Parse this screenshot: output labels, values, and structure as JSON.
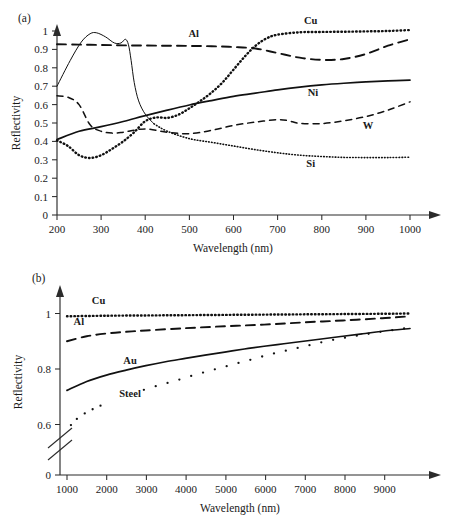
{
  "figure": {
    "background": "#ffffff",
    "ink_color": "#111111"
  },
  "chart_data": [
    {
      "id": "panel-a",
      "type": "line",
      "panel_label": "(a)",
      "title": "",
      "xlabel": "Wavelength (nm)",
      "ylabel": "Reflectivity",
      "xlim": [
        200,
        1000
      ],
      "ylim": [
        0,
        1
      ],
      "xticks": [
        200,
        300,
        400,
        500,
        600,
        700,
        800,
        900,
        1000
      ],
      "xtick_labels": [
        "200",
        "300",
        "400",
        "500",
        "600",
        "700",
        "800",
        "900",
        "1000"
      ],
      "yticks": [
        0,
        0.1,
        0.2,
        0.3,
        0.4,
        0.5,
        0.6,
        0.7,
        0.8,
        0.9,
        1
      ],
      "ytick_labels": [
        "0",
        "0.1",
        "0.2",
        "0.3",
        "0.4",
        "0.5",
        "0.6",
        "0.7",
        "0.8",
        "0.9",
        "1"
      ],
      "grid": false,
      "legend_position": "inline-curve-labels",
      "series": [
        {
          "name": "Al",
          "label": "Al",
          "style": "long-dashed",
          "label_x": 510,
          "label_y": 0.965,
          "x": [
            200,
            250,
            300,
            350,
            400,
            450,
            500,
            550,
            600,
            650,
            700,
            750,
            800,
            850,
            900,
            950,
            1000
          ],
          "values": [
            0.928,
            0.926,
            0.924,
            0.922,
            0.921,
            0.92,
            0.919,
            0.917,
            0.913,
            0.905,
            0.88,
            0.855,
            0.843,
            0.848,
            0.875,
            0.92,
            0.955
          ]
        },
        {
          "name": "Cu",
          "label": "Cu",
          "style": "dotted",
          "label_x": 775,
          "label_y": 1.04,
          "x": [
            200,
            225,
            250,
            275,
            300,
            325,
            350,
            375,
            400,
            425,
            450,
            475,
            500,
            525,
            550,
            575,
            600,
            625,
            650,
            675,
            700,
            750,
            800,
            850,
            900,
            950,
            1000
          ],
          "values": [
            0.405,
            0.375,
            0.325,
            0.31,
            0.325,
            0.36,
            0.4,
            0.45,
            0.51,
            0.53,
            0.528,
            0.545,
            0.58,
            0.62,
            0.665,
            0.72,
            0.79,
            0.86,
            0.92,
            0.96,
            0.98,
            0.993,
            0.995,
            0.996,
            0.998,
            1.0,
            1.005
          ]
        },
        {
          "name": "Ni",
          "label": "Ni",
          "style": "solid-thick",
          "label_x": 780,
          "label_y": 0.645,
          "x": [
            200,
            250,
            300,
            350,
            400,
            450,
            500,
            550,
            600,
            650,
            700,
            750,
            800,
            850,
            900,
            950,
            1000
          ],
          "values": [
            0.41,
            0.455,
            0.48,
            0.508,
            0.54,
            0.57,
            0.598,
            0.622,
            0.645,
            0.662,
            0.68,
            0.695,
            0.707,
            0.716,
            0.723,
            0.729,
            0.733
          ]
        },
        {
          "name": "W",
          "label": "W",
          "style": "short-dashed",
          "label_x": 905,
          "label_y": 0.47,
          "x": [
            200,
            225,
            250,
            275,
            300,
            325,
            350,
            400,
            450,
            500,
            550,
            600,
            650,
            700,
            725,
            750,
            800,
            850,
            900,
            950,
            1000
          ],
          "values": [
            0.648,
            0.64,
            0.6,
            0.49,
            0.455,
            0.445,
            0.45,
            0.468,
            0.45,
            0.442,
            0.46,
            0.487,
            0.505,
            0.518,
            0.512,
            0.498,
            0.497,
            0.512,
            0.535,
            0.57,
            0.615
          ]
        },
        {
          "name": "Si",
          "label": "Si",
          "style": "thin-solid-then-dotted",
          "label_x": 775,
          "label_y": 0.262,
          "x": [
            200,
            230,
            255,
            275,
            290,
            310,
            330,
            345,
            355,
            362,
            368,
            375,
            385,
            400,
            420,
            450,
            500,
            550,
            600,
            650,
            700,
            750,
            800,
            850,
            900,
            950,
            1000
          ],
          "values": [
            0.7,
            0.84,
            0.94,
            0.985,
            0.99,
            0.968,
            0.935,
            0.935,
            0.955,
            0.925,
            0.84,
            0.72,
            0.62,
            0.548,
            0.495,
            0.455,
            0.415,
            0.395,
            0.375,
            0.355,
            0.338,
            0.325,
            0.318,
            0.313,
            0.312,
            0.312,
            0.314
          ]
        }
      ]
    },
    {
      "id": "panel-b",
      "type": "line",
      "panel_label": "(b)",
      "title": "",
      "xlabel": "Wavelength (nm)",
      "ylabel": "Reflectivity",
      "xlim": [
        1000,
        9700
      ],
      "ylim": [
        0.58,
        1.02
      ],
      "xticks": [
        1000,
        2000,
        3000,
        4000,
        5000,
        6000,
        7000,
        8000,
        9000
      ],
      "xtick_labels": [
        "1000",
        "2000",
        "3000",
        "4000",
        "5000",
        "6000",
        "7000",
        "8000",
        "9000"
      ],
      "yticks": [
        0,
        0.6,
        0.8,
        1
      ],
      "ytick_labels": [
        "0",
        "0.6",
        "0.8",
        "1"
      ],
      "axis_break": true,
      "grid": false,
      "legend_position": "inline-curve-labels",
      "series": [
        {
          "name": "Cu",
          "label": "Cu",
          "style": "dotted",
          "label_x": 1800,
          "label_y": 1.035,
          "x": [
            1000,
            2000,
            3000,
            4000,
            5000,
            6000,
            7000,
            8000,
            9000,
            9700
          ],
          "values": [
            0.99,
            0.992,
            0.993,
            0.994,
            0.995,
            0.996,
            0.997,
            0.998,
            0.999,
            1.0
          ]
        },
        {
          "name": "Al",
          "label": "Al",
          "style": "long-dashed",
          "label_x": 1300,
          "label_y": 0.96,
          "x": [
            1000,
            1500,
            2000,
            2500,
            3000,
            4000,
            5000,
            6000,
            7000,
            8000,
            9000,
            9700
          ],
          "values": [
            0.9,
            0.918,
            0.928,
            0.934,
            0.939,
            0.947,
            0.954,
            0.96,
            0.968,
            0.975,
            0.983,
            0.99
          ]
        },
        {
          "name": "Au",
          "label": "Au",
          "style": "solid-thick",
          "label_x": 2600,
          "label_y": 0.818,
          "x": [
            1000,
            1500,
            2000,
            2500,
            3000,
            3500,
            4000,
            4500,
            5000,
            5500,
            6000,
            6500,
            7000,
            7500,
            8000,
            8500,
            9000,
            9700
          ],
          "values": [
            0.723,
            0.755,
            0.778,
            0.796,
            0.812,
            0.826,
            0.838,
            0.85,
            0.861,
            0.872,
            0.882,
            0.891,
            0.9,
            0.909,
            0.918,
            0.927,
            0.936,
            0.946
          ]
        },
        {
          "name": "Steel",
          "label": "Steel",
          "style": "dotted-sparse",
          "label_x": 2600,
          "label_y": 0.7,
          "x": [
            1100,
            1250,
            1450,
            1650,
            1850,
            2950,
            3250,
            3550,
            3850,
            4150,
            4450,
            4750,
            5050,
            5350,
            5650,
            5950,
            6250,
            6550,
            6850,
            7150,
            7450,
            7750,
            8050,
            8350,
            8650,
            8950,
            9250,
            9550
          ],
          "values": [
            0.598,
            0.62,
            0.64,
            0.655,
            0.668,
            0.725,
            0.738,
            0.75,
            0.762,
            0.775,
            0.787,
            0.799,
            0.81,
            0.822,
            0.833,
            0.845,
            0.856,
            0.866,
            0.876,
            0.886,
            0.896,
            0.905,
            0.913,
            0.92,
            0.927,
            0.934,
            0.94,
            0.946
          ]
        }
      ]
    }
  ]
}
